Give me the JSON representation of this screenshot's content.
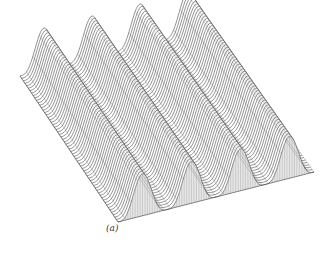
{
  "figure": {
    "caption": "(a)"
  },
  "chart_data": {
    "type": "surface",
    "title": "",
    "caption": "(a)",
    "xlabel": "",
    "ylabel": "",
    "zlabel": "",
    "grid": false,
    "legend": null,
    "surface": {
      "function": "z = A * max(0, sin(2*pi*k*u))^p (periodic ridges along one axis, constant along the other)",
      "ridge_count": 4,
      "amplitude_px": 42,
      "grid_lines_u": 60,
      "grid_lines_v": 30
    },
    "projection": {
      "corner_left": [
        20,
        76
      ],
      "corner_back": [
        212,
        28
      ],
      "corner_right": [
        314,
        172
      ],
      "corner_front": [
        118,
        222
      ]
    },
    "colors": {
      "line": "#3a3a3a",
      "fill": "#ffffff",
      "side_fill": "#e6e6e6"
    }
  }
}
